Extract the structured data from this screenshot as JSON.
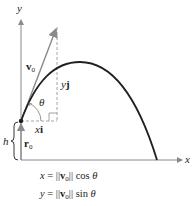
{
  "diagram": {
    "type": "projectile-motion",
    "axes": {
      "x_label": "x",
      "y_label": "y"
    },
    "vectors": {
      "initial_velocity": {
        "symbol": "v",
        "subscript": "0"
      },
      "initial_position": {
        "symbol": "r",
        "subscript": "0"
      },
      "horizontal_component": {
        "scalar": "x",
        "unit": "i"
      },
      "vertical_component": {
        "scalar": "y",
        "unit": "j"
      }
    },
    "angle_label": "θ",
    "height_label": "h",
    "equations": [
      {
        "lhs": "x",
        "op": " = ",
        "norm_open": "||",
        "vec": "v",
        "sub": "0",
        "norm_close": "||",
        "func": " cos ",
        "arg": "θ"
      },
      {
        "lhs": "y",
        "op": " = ",
        "norm_open": "||",
        "vec": "v",
        "sub": "0",
        "norm_close": "||",
        "func": " sin ",
        "arg": "θ"
      }
    ],
    "colors": {
      "ink": "#231f20",
      "vector_gray": "#8a8a8a",
      "dashed_gray": "#9a9a9a"
    }
  }
}
